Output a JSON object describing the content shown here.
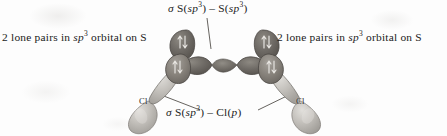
{
  "figure": {
    "name": "sigma-bonding-orbital-diagram-S2Cl2",
    "background_color": "#fdfdfd"
  },
  "labels": {
    "sigma_ss": {
      "text": "σ S(sp3) – S(sp3)",
      "parts": {
        "sigma": "σ",
        "a": " S(",
        "sp": "sp",
        "exp": "3",
        "b": ") – S(",
        "sp2": "sp",
        "exp2": "3",
        "c": ")"
      }
    },
    "lone_pairs_left": {
      "parts": {
        "a": "2 lone pairs in ",
        "sp": "sp",
        "exp": "3",
        "b": " orbital on S"
      }
    },
    "lone_pairs_right": {
      "parts": {
        "a": "2 lone pairs in ",
        "sp": "sp",
        "exp": "3",
        "b": " orbital on S"
      }
    },
    "sigma_scl": {
      "parts": {
        "sigma": "σ",
        "a": " S(",
        "sp": "sp",
        "exp": "3",
        "b": ") – Cl(",
        "p": "p",
        "c": ")"
      }
    }
  },
  "atoms": {
    "chlorine_left": "Cl",
    "chlorine_right": "Cl"
  },
  "colors": {
    "sulfur_orbital_dark": "#6b6762",
    "sulfur_orbital_mid": "#827e78",
    "chlorine_orbital_light": "#b8b5b0",
    "chlorine_orbital_highlight": "#d6d4d0",
    "outline": "#4a4642",
    "leader_line": "#55514d",
    "electron_arrow": "#e6e4e0",
    "text": "#1b1b1b"
  },
  "electron_pairs": {
    "left_sulfur": [
      "↑↓",
      "↑↓"
    ],
    "right_sulfur": [
      "↑↓",
      "↑↓"
    ],
    "count_per_sulfur": 2,
    "glyph": "↑↓"
  },
  "structure": {
    "type": "orbital-overlap-diagram",
    "molecule": "S2Cl2",
    "bonds": [
      {
        "name": "sigma-S-S",
        "orbitals": "S(sp3) - S(sp3)"
      },
      {
        "name": "sigma-S-Cl-left",
        "orbitals": "S(sp3) - Cl(p)"
      },
      {
        "name": "sigma-S-Cl-right",
        "orbitals": "S(sp3) - Cl(p)"
      }
    ]
  }
}
